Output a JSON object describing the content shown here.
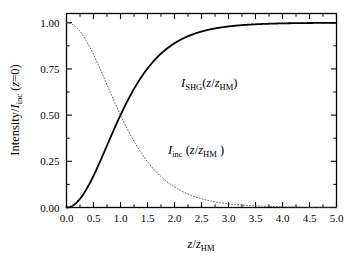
{
  "chart_data": {
    "type": "line",
    "title": "",
    "subtitle": "",
    "xlabel": "z/z_HM",
    "ylabel": "Intensity/I_inc (z=0)",
    "xlim": [
      0.0,
      5.0
    ],
    "ylim": [
      0.0,
      1.05
    ],
    "grid": false,
    "legend": "none",
    "x_ticks": [
      "0.0",
      "0.5",
      "1.0",
      "1.5",
      "2.0",
      "2.5",
      "3.0",
      "3.5",
      "4.0",
      "4.5",
      "5.0"
    ],
    "x_tick_values": [
      0.0,
      0.5,
      1.0,
      1.5,
      2.0,
      2.5,
      3.0,
      3.5,
      4.0,
      4.5,
      5.0
    ],
    "x_minor_step": 0.25,
    "y_ticks": [
      "0.00",
      "0.25",
      "0.50",
      "0.75",
      "1.00"
    ],
    "y_tick_values": [
      0.0,
      0.25,
      0.5,
      0.75,
      1.0
    ],
    "y_minor_step": 0.125,
    "tick_direction": "in",
    "x": [
      0.0,
      0.1,
      0.2,
      0.3,
      0.4,
      0.5,
      0.6,
      0.7,
      0.8,
      0.9,
      1.0,
      1.1,
      1.2,
      1.3,
      1.4,
      1.5,
      1.6,
      1.7,
      1.8,
      1.9,
      2.0,
      2.2,
      2.4,
      2.6,
      2.8,
      3.0,
      3.2,
      3.4,
      3.6,
      3.8,
      4.0,
      4.2,
      4.4,
      4.6,
      4.8,
      5.0
    ],
    "series": [
      {
        "name": "I_SHG(z/z_HM)",
        "style": "solid",
        "color": "#000000",
        "width": 1.8,
        "values": [
          0.0,
          0.0077,
          0.0305,
          0.0673,
          0.1158,
          0.1731,
          0.2356,
          0.2999,
          0.3632,
          0.423,
          0.4781,
          0.5277,
          0.5715,
          0.6098,
          0.6429,
          0.6713,
          0.6955,
          0.7161,
          0.7337,
          0.7486,
          0.7613,
          0.7811,
          0.7953,
          0.8055,
          0.8128,
          0.818,
          0.8217,
          0.8243,
          0.8261,
          0.8274,
          0.8284,
          0.829,
          0.8295,
          0.8298,
          0.83,
          0.8302
        ]
      },
      {
        "name": "I_inc (z/z_HM )",
        "style": "dotted",
        "color": "#555555",
        "width": 1.0,
        "values": [
          1.0,
          0.9923,
          0.9695,
          0.9327,
          0.8842,
          0.8269,
          0.7644,
          0.7001,
          0.6368,
          0.577,
          0.5219,
          0.4723,
          0.4285,
          0.3902,
          0.3571,
          0.3287,
          0.3045,
          0.2839,
          0.2663,
          0.2514,
          0.2387,
          0.2189,
          0.2047,
          0.1945,
          0.1872,
          0.182,
          0.1783,
          0.1757,
          0.1739,
          0.1726,
          0.1716,
          0.171,
          0.1705,
          0.1702,
          0.17,
          0.1698
        ]
      }
    ],
    "annotations": [
      {
        "name": "shg-curve-label",
        "text": "I_SHG(z/z_HM)",
        "x": 2.15,
        "y": 0.855
      },
      {
        "name": "inc-curve-label",
        "text": "I_inc (z/z_HM )",
        "x": 2.0,
        "y": 0.305
      }
    ]
  },
  "axes": {
    "y_label_parts": {
      "main": "Intensity/",
      "italic_i": "I",
      "sub": "inc",
      "paren": "(",
      "italic_z": "z",
      "eq_zero": "=0)"
    },
    "x_label_parts": {
      "italic_z1": "z",
      "slash": "/",
      "italic_z2": "z",
      "sub": "HM"
    }
  },
  "curve_labels": {
    "shg": {
      "italic_i": "I",
      "sub": "SHG",
      "open": "(",
      "italic_z1": "z",
      "slash": "/",
      "italic_z2": "z",
      "sub2": "HM",
      "close": ")"
    },
    "inc": {
      "italic_i": "I",
      "sub": "inc",
      "open": " (",
      "italic_z1": "z",
      "slash": "/",
      "italic_z2": "z",
      "sub2": "HM",
      "close": " )"
    }
  }
}
